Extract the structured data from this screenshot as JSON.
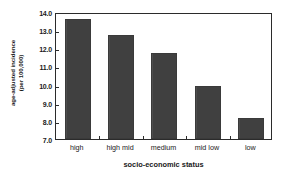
{
  "chart_data": {
    "type": "bar",
    "title": "",
    "categories": [
      "high",
      "high mid",
      "medium",
      "mid low",
      "low"
    ],
    "values": [
      13.6,
      12.75,
      11.75,
      9.9,
      8.15
    ],
    "xlabel": "socio-economic status",
    "ylabel": "age-adjusted incidence (per 100,000)",
    "ylabel_line1": "age-adjusted incidence",
    "ylabel_line2": "(per 100,000)",
    "ylim": [
      7.0,
      14.0
    ],
    "yticks": [
      "14.0",
      "13.0",
      "12.0",
      "11.0",
      "10.0",
      "9.0",
      "8.0",
      "7.0"
    ],
    "ytick_values": [
      14.0,
      13.0,
      12.0,
      11.0,
      10.0,
      9.0,
      8.0,
      7.0
    ],
    "grid": false,
    "legend": null,
    "bar_color": "#404040",
    "axis_color": "#2b2b2b",
    "background_color": "#ffffff"
  }
}
